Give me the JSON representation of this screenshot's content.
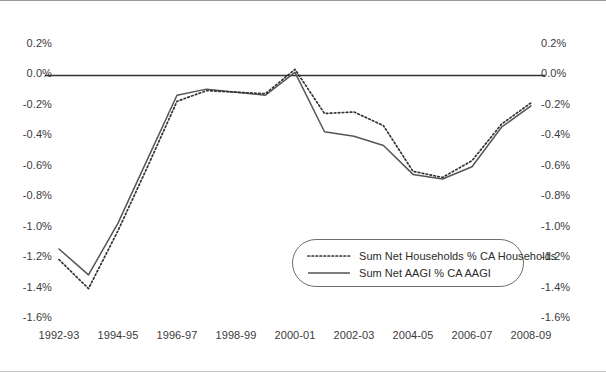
{
  "chart_data": {
    "type": "line",
    "title": "",
    "subtitle": "",
    "xlabel": "",
    "ylabel": "",
    "ylim": [
      -1.6,
      0.2
    ],
    "ytick_step": 0.2,
    "grid": false,
    "zero_line": true,
    "legend_position": "inside-bottom-center",
    "y_axis_both_sides": true,
    "y_ticks": [
      "0.2%",
      "0.0%",
      "-0.2%",
      "-0.4%",
      "-0.6%",
      "-0.8%",
      "-1.0%",
      "-1.2%",
      "-1.4%",
      "-1.6%"
    ],
    "y_tick_values": [
      0.2,
      0.0,
      -0.2,
      -0.4,
      -0.6,
      -0.8,
      -1.0,
      -1.2,
      -1.4,
      -1.6
    ],
    "y_ticks_right": [
      "0.2%",
      "0.0%",
      "-0.2%",
      "-0.4%",
      "-0.6%",
      "-0.8%",
      "-1.0%",
      "-1.2%",
      "-1.4%",
      "-1.6%"
    ],
    "x": [
      "1992-93",
      "1993-94",
      "1994-95",
      "1995-96",
      "1996-97",
      "1997-98",
      "1998-99",
      "1999-00",
      "2000-01",
      "2001-02",
      "2002-03",
      "2003-04",
      "2004-05",
      "2005-06",
      "2006-07",
      "2007-08",
      "2008-09"
    ],
    "x_tick_labels": [
      "1992-93",
      "1994-95",
      "1996-97",
      "1998-99",
      "2000-01",
      "2002-03",
      "2004-05",
      "2006-07",
      "2008-09"
    ],
    "x_tick_indices": [
      0,
      2,
      4,
      6,
      8,
      10,
      12,
      14,
      16
    ],
    "series": [
      {
        "name": "Sum Net Households % CA Households",
        "style": "dotted",
        "color": "#333333",
        "values": [
          -1.21,
          -1.4,
          -1.02,
          -0.6,
          -0.17,
          -0.1,
          -0.11,
          -0.12,
          0.04,
          -0.25,
          -0.24,
          -0.33,
          -0.63,
          -0.67,
          -0.56,
          -0.32,
          -0.18
        ]
      },
      {
        "name": "Sum Net AAGI % CA AAGI",
        "style": "solid",
        "color": "#555555",
        "values": [
          -1.14,
          -1.31,
          -0.97,
          -0.55,
          -0.13,
          -0.09,
          -0.11,
          -0.13,
          0.02,
          -0.37,
          -0.4,
          -0.46,
          -0.65,
          -0.68,
          -0.6,
          -0.34,
          -0.2
        ]
      }
    ]
  },
  "legend": {
    "items": [
      {
        "label": "Sum Net Households % CA Households",
        "style": "dotted"
      },
      {
        "label": "Sum Net AAGI % CA AAGI",
        "style": "solid"
      }
    ]
  },
  "colors": {
    "series_dotted": "#333333",
    "series_solid": "#555555",
    "axis_text": "#3b3b3b",
    "zero_line": "#333333",
    "background": "#ffffff",
    "legend_border": "#6f6f6f"
  }
}
